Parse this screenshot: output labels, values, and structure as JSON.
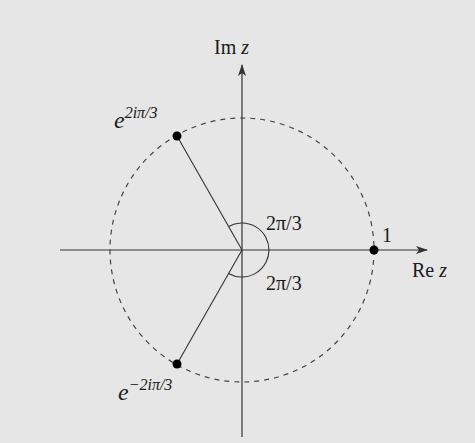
{
  "diagram": {
    "background": "#e6e6e6",
    "stroke_color": "#333333",
    "axes": {
      "x_label_prefix": "Re",
      "x_label_var": "z",
      "y_label_prefix": "Im",
      "y_label_var": "z"
    },
    "circle": {
      "style": "dashed",
      "radius_units": 1
    },
    "points": [
      {
        "id": "one",
        "label": "1",
        "angle_deg": 0
      },
      {
        "id": "omega",
        "label_base": "e",
        "label_exp": "2iπ/3",
        "angle_deg": 120
      },
      {
        "id": "omega_bar",
        "label_base": "e",
        "label_exp": "−2iπ/3",
        "angle_deg": -120
      }
    ],
    "angle_labels": {
      "upper": "2π/3",
      "lower": "2π/3"
    }
  }
}
